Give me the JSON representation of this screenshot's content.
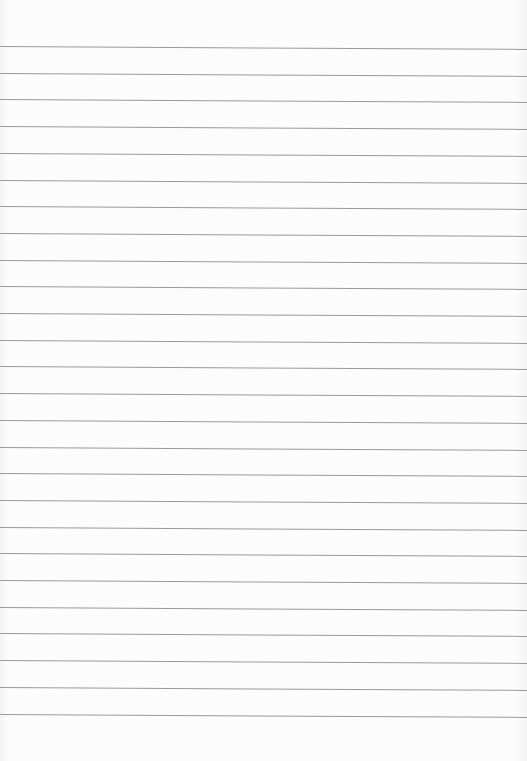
{
  "paper": {
    "type": "lined-paper",
    "background_color": "#fbfbfb",
    "line_color": "#9a9a9a",
    "line_count": 26,
    "first_line_y": 46,
    "line_spacing": 26.7
  }
}
